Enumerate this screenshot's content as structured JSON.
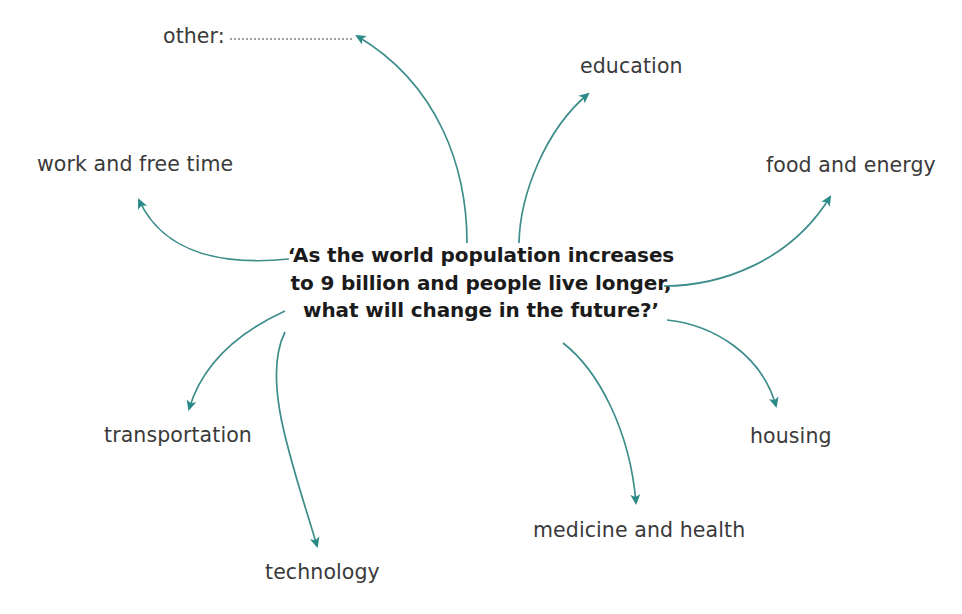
{
  "diagram": {
    "type": "mind-map",
    "accent_color": "#2a8a86",
    "text_color": "#3a3a3a",
    "center_text_color": "#1b1b1b",
    "background_color": "#ffffff",
    "center": {
      "lines": [
        "‘As the world population increases",
        "to 9 billion and people live longer,",
        "what will change in the future?’"
      ]
    },
    "branches": [
      {
        "id": "other",
        "label": "other:",
        "has_fill_in_line": true
      },
      {
        "id": "education",
        "label": "education",
        "has_fill_in_line": false
      },
      {
        "id": "food-and-energy",
        "label": "food and energy",
        "has_fill_in_line": false
      },
      {
        "id": "housing",
        "label": "housing",
        "has_fill_in_line": false
      },
      {
        "id": "medicine-and-health",
        "label": "medicine and health",
        "has_fill_in_line": false
      },
      {
        "id": "technology",
        "label": "technology",
        "has_fill_in_line": false
      },
      {
        "id": "transportation",
        "label": "transportation",
        "has_fill_in_line": false
      },
      {
        "id": "work-and-free-time",
        "label": "work and free time",
        "has_fill_in_line": false
      }
    ]
  }
}
